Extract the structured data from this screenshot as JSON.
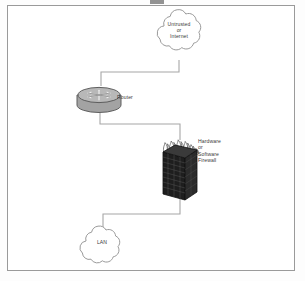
{
  "diagram": {
    "frame": {
      "border_color": "#9a9a9a",
      "background": "#ffffff"
    },
    "nodes": [
      {
        "id": "internet-cloud",
        "icon": "cloud-icon",
        "shape": "cloud",
        "label_lines": [
          "Untrusted",
          "or",
          "Internet"
        ],
        "line1": "Untrusted",
        "line2": "or",
        "line3": "Internet"
      },
      {
        "id": "router",
        "icon": "router-icon",
        "shape": "cylinder-with-crossed-arrows",
        "label": "Router",
        "body_color": "#9b9b9b",
        "outline_color": "#5c5c5c"
      },
      {
        "id": "firewall",
        "icon": "firewall-icon",
        "shape": "brick-wall-with-flames",
        "label_lines": [
          "Hardware",
          "or",
          "Software",
          "Firewall"
        ],
        "line1": "Hardware",
        "line2": "or",
        "line3": "Software",
        "line4": "Firewall",
        "wall_color": "#1d1d1d",
        "flame_color": "#7a7a7a"
      },
      {
        "id": "lan-cloud",
        "icon": "cloud-icon",
        "shape": "cloud",
        "label": "LAN"
      }
    ],
    "connectors": [
      {
        "id": "internet-to-router",
        "from": "internet-cloud",
        "to": "router",
        "style": "stepped-orthogonal",
        "color": "#9a9a9a"
      },
      {
        "id": "router-to-firewall",
        "from": "router",
        "to": "firewall",
        "style": "stepped-orthogonal",
        "color": "#9a9a9a"
      },
      {
        "id": "firewall-to-lan",
        "from": "firewall",
        "to": "lan-cloud",
        "style": "stepped-orthogonal",
        "color": "#9a9a9a"
      }
    ]
  }
}
